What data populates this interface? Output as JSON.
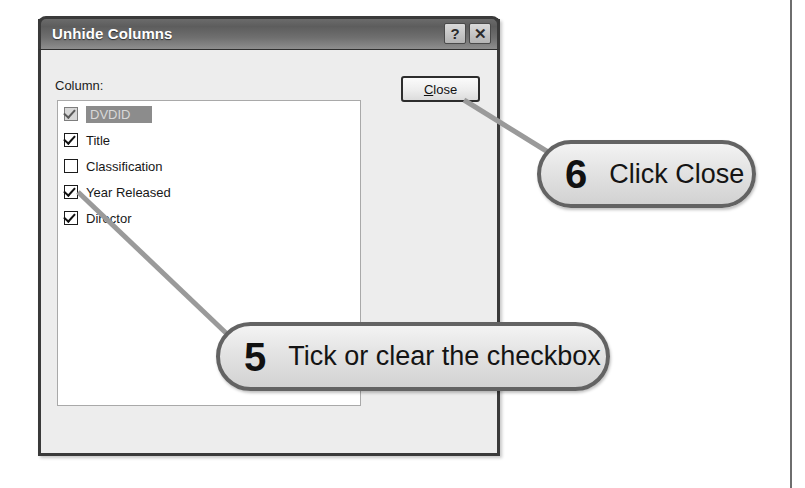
{
  "dialog": {
    "title": "Unhide Columns",
    "help_button": "?",
    "close_button_glyph": "✕",
    "column_label": "Column:",
    "columns": [
      {
        "label": "DVDID",
        "checked": true,
        "selected": true
      },
      {
        "label": "Title",
        "checked": true,
        "selected": false
      },
      {
        "label": "Classification",
        "checked": false,
        "selected": false
      },
      {
        "label": "Year Released",
        "checked": true,
        "selected": false
      },
      {
        "label": "Director",
        "checked": true,
        "selected": false
      }
    ],
    "close_action": {
      "accel": "C",
      "rest": "lose",
      "full_label": "Close"
    }
  },
  "callouts": [
    {
      "number": "5",
      "text": "Tick or clear the checkbox"
    },
    {
      "number": "6",
      "text": "Click Close"
    }
  ],
  "colors": {
    "titlebar": "#5d5d5d",
    "dialog_face": "#ededed",
    "callout_border": "#636363",
    "selection": "#8c8c8c",
    "leader_line": "#9a9a9a"
  }
}
